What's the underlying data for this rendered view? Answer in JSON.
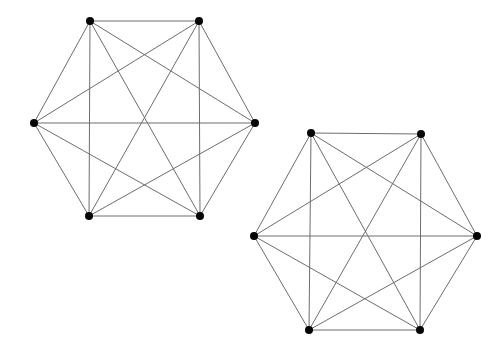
{
  "page": {
    "background_color": "#ffffff",
    "width": 488,
    "height": 362
  },
  "style": {
    "edge_color": "#6d6d6d",
    "edge_width": 1,
    "vertex_color": "#050505",
    "vertex_radius": 4
  },
  "chart_data": {
    "type": "diagram",
    "subtype": "graph-drawing",
    "title": "",
    "xlabel": "",
    "ylabel": "",
    "grid": false,
    "legend": false,
    "axes_visible": false,
    "xlim": [
      0,
      488
    ],
    "ylim": [
      0,
      362
    ],
    "graphs": [
      {
        "name": "left-graph",
        "label": "K6",
        "vertex_count": 6,
        "edge_count": 15,
        "complete": true,
        "layout": "regular-hexagon",
        "center": [
          144.5,
          118.5
        ],
        "nodes": [
          {
            "id": 0,
            "x": 90,
            "y": 21
          },
          {
            "id": 1,
            "x": 199,
            "y": 21
          },
          {
            "id": 2,
            "x": 255,
            "y": 123
          },
          {
            "id": 3,
            "x": 200,
            "y": 216
          },
          {
            "id": 4,
            "x": 89,
            "y": 216
          },
          {
            "id": 5,
            "x": 34,
            "y": 123
          }
        ],
        "edges": [
          [
            0,
            1
          ],
          [
            0,
            2
          ],
          [
            0,
            3
          ],
          [
            0,
            4
          ],
          [
            0,
            5
          ],
          [
            1,
            2
          ],
          [
            1,
            3
          ],
          [
            1,
            4
          ],
          [
            1,
            5
          ],
          [
            2,
            3
          ],
          [
            2,
            4
          ],
          [
            2,
            5
          ],
          [
            3,
            4
          ],
          [
            3,
            5
          ],
          [
            4,
            5
          ]
        ]
      },
      {
        "name": "right-graph",
        "label": "K6",
        "vertex_count": 6,
        "edge_count": 15,
        "complete": true,
        "layout": "regular-hexagon",
        "center": [
          365.5,
          231.5
        ],
        "nodes": [
          {
            "id": 0,
            "x": 311,
            "y": 133
          },
          {
            "id": 1,
            "x": 421,
            "y": 134
          },
          {
            "id": 2,
            "x": 477,
            "y": 236
          },
          {
            "id": 3,
            "x": 420,
            "y": 330
          },
          {
            "id": 4,
            "x": 309,
            "y": 330
          },
          {
            "id": 5,
            "x": 254,
            "y": 236
          }
        ],
        "edges": [
          [
            0,
            1
          ],
          [
            0,
            2
          ],
          [
            0,
            3
          ],
          [
            0,
            4
          ],
          [
            0,
            5
          ],
          [
            1,
            2
          ],
          [
            1,
            3
          ],
          [
            1,
            4
          ],
          [
            1,
            5
          ],
          [
            2,
            3
          ],
          [
            2,
            4
          ],
          [
            2,
            5
          ],
          [
            3,
            4
          ],
          [
            3,
            5
          ],
          [
            4,
            5
          ]
        ]
      }
    ]
  }
}
